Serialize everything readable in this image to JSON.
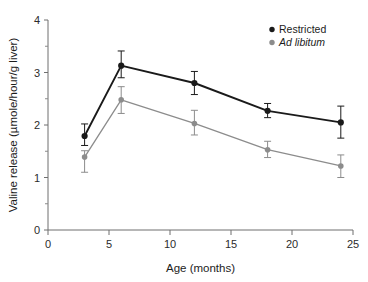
{
  "chart_data": {
    "type": "line",
    "title": "",
    "xlabel": "Age (months)",
    "ylabel": "Valine release (µmole/hour/g liver)",
    "x": [
      3,
      6,
      12,
      18,
      24
    ],
    "xlim": [
      0,
      25
    ],
    "ylim": [
      0,
      4
    ],
    "xticks": [
      0,
      5,
      10,
      15,
      20,
      25
    ],
    "yticks": [
      0,
      1,
      2,
      3,
      4
    ],
    "xtick_labels": [
      "0",
      "5",
      "10",
      "15",
      "20",
      "25"
    ],
    "ytick_labels": [
      "0",
      "1",
      "2",
      "3",
      "4"
    ],
    "x_minor_ticks": [],
    "y_minor_ticks": [
      0.5,
      1.5,
      2.5,
      3.5
    ],
    "grid": false,
    "legend_position": "top-right",
    "series": [
      {
        "name": "Restricted",
        "color": "#1a1a1a",
        "italic": false,
        "marker": "circle",
        "values": [
          1.79,
          3.13,
          2.8,
          2.27,
          2.05
        ],
        "err_low": [
          0.18,
          0.23,
          0.22,
          0.13,
          0.3
        ],
        "err_high": [
          0.23,
          0.28,
          0.22,
          0.14,
          0.31
        ]
      },
      {
        "name": "Ad libitum",
        "color": "#8c8c8c",
        "italic": true,
        "marker": "circle",
        "values": [
          1.39,
          2.48,
          2.03,
          1.53,
          1.22
        ],
        "err_low": [
          0.29,
          0.26,
          0.22,
          0.15,
          0.22
        ],
        "err_high": [
          0.12,
          0.25,
          0.25,
          0.16,
          0.21
        ]
      }
    ]
  },
  "legend": {
    "items": [
      {
        "label": "Restricted",
        "color": "#1a1a1a",
        "italic": false
      },
      {
        "label": "Ad libitum",
        "color": "#8c8c8c",
        "italic": true
      }
    ]
  },
  "axes": {
    "x_title": "Age (months)",
    "y_title": "Valine release (µmole/hour/g liver)"
  }
}
